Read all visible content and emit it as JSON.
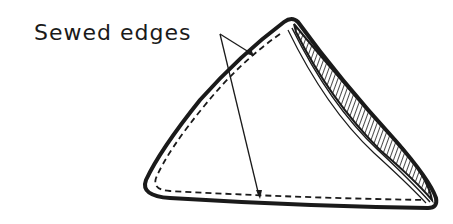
{
  "figure": {
    "label": "Sewed edges",
    "colors": {
      "ink": "#1a1a1a",
      "background": "#ffffff"
    },
    "annotations": [
      {
        "text": "Sewed edges",
        "points_to": [
          "upper-left sewed edge",
          "bottom sewed edge"
        ]
      }
    ]
  }
}
